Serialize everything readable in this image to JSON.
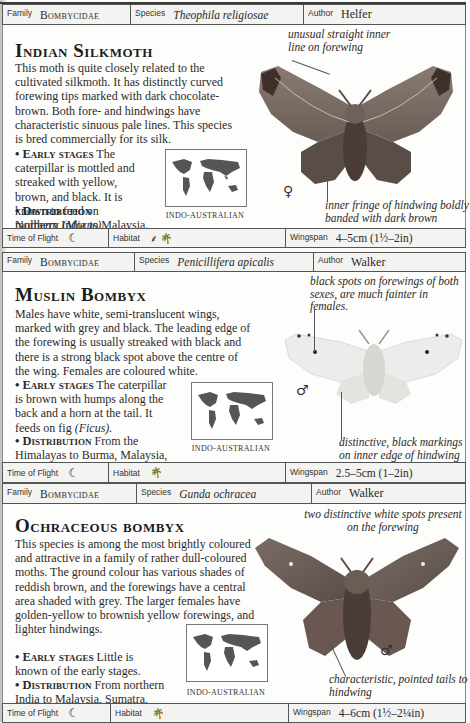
{
  "labels": {
    "family": "Family",
    "species": "Species",
    "author": "Author",
    "time_of_flight": "Time of Flight",
    "habitat": "Habitat",
    "wingspan": "Wingspan"
  },
  "entries": [
    {
      "family": "Bombycidae",
      "species": "Theophila religiosae",
      "author": "Helfer",
      "title": "Indian Silkmoth",
      "description": "This moth is quite closely related to the cultivated silkmoth. It has distinctly curved forewing tips marked with dark chocolate-brown. Both fore- and hindwings have characteristic sinuous pale lines. This species is bred commercially for its silk.",
      "early_stages_label": "Early stages",
      "early_stages": "The caterpillar is mottled and streaked with yellow, brown, and black. It is known to feed on mulberry",
      "early_stages_genus": "(Morus).",
      "distribution_label": "Distribution",
      "distribution": "Northern India to Malaysia.",
      "map_label": "INDO-AUSTRALIAN",
      "sex_symbol": "♀",
      "annotations": [
        "unusual straight inner line on forewing",
        "inner fringe of hindwing boldly banded with dark brown"
      ],
      "time_of_flight_icon": "crescent-moon-icon",
      "time_of_flight_glyph": "☾",
      "habitat_icons": [
        "grassland-icon",
        "palm-tree-icon"
      ],
      "habitat_glyphs": [
        "⸙",
        "🌴"
      ],
      "wingspan": "4–5cm (1½–2in)"
    },
    {
      "family": "Bombycidae",
      "species": "Penicillifera apicalis",
      "author": "Walker",
      "title": "Muslin Bombyx",
      "description": "Males have white, semi-translucent wings, marked with grey and black. The leading edge of the forewing is usually streaked with black and there is a strong black spot above the centre of the wing. Females are coloured white.",
      "early_stages_label": "Early stages",
      "early_stages": "The caterpillar is brown with humps along the back and a horn at the tail. It feeds on fig",
      "early_stages_genus": "(Ficus).",
      "distribution_label": "Distribution",
      "distribution": "From the Himalayas to Burma, Malaysia, and the Philippines.",
      "map_label": "INDO-AUSTRALIAN",
      "sex_symbol": "♂",
      "annotations": [
        "black spots on forewings of both sexes, are much fainter in females.",
        "distinctive, black markings on inner edge of hindwing"
      ],
      "time_of_flight_icon": "crescent-moon-icon",
      "time_of_flight_glyph": "☾",
      "habitat_icons": [
        "palm-tree-icon"
      ],
      "habitat_glyphs": [
        "🌴"
      ],
      "wingspan": "2.5–5cm (1–2in)"
    },
    {
      "family": "Bombycidae",
      "species": "Gunda ochracea",
      "author": "Walker",
      "title": "Ochraceous bombyx",
      "description": "This species is among the most brightly coloured and attractive in a family of rather dull-coloured moths. The ground colour has various shades of reddish brown, and the forewings have a central area shaded with grey. The larger females have golden-yellow to brownish yellow forewings, and lighter hindwings.",
      "early_stages_label": "Early stages",
      "early_stages": "Little is known of the early stages.",
      "early_stages_genus": "",
      "distribution_label": "Distribution",
      "distribution": "From northern India to Malaysia, Sumatra, and the Philippines.",
      "map_label": "INDO-AUSTRALIAN",
      "sex_symbol": "♂",
      "annotations": [
        "two distinctive white spots present on the forewing",
        "characteristic, pointed tails to hindwing"
      ],
      "time_of_flight_icon": "crescent-moon-icon",
      "time_of_flight_glyph": "☾",
      "habitat_icons": [
        "palm-tree-icon"
      ],
      "habitat_glyphs": [
        "🌴"
      ],
      "wingspan": "4–6cm (1½–2¼in)"
    }
  ]
}
